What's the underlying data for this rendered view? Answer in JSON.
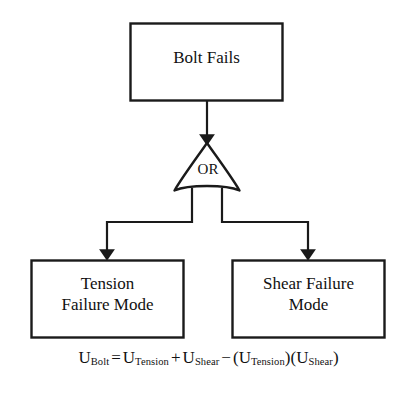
{
  "diagram": {
    "type": "fault-tree",
    "title_node": {
      "id": "top-event",
      "label": "Bolt Fails",
      "shape": "rectangle"
    },
    "gate": {
      "id": "or-gate",
      "label": "OR",
      "shape": "or-gate"
    },
    "children": [
      {
        "id": "tension-failure",
        "label": "Tension\nFailure Mode",
        "shape": "rectangle"
      },
      {
        "id": "shear-failure",
        "label": "Shear Failure\nMode",
        "shape": "rectangle"
      }
    ],
    "equation": {
      "lhs_symbol": "U",
      "lhs_sub": "Bolt",
      "eq": "=",
      "t1_symbol": "U",
      "t1_sub": "Tension",
      "plus": "+",
      "t2_symbol": "U",
      "t2_sub": "Shear",
      "minus": "−",
      "open1": "(",
      "t3_symbol": "U",
      "t3_sub": "Tension",
      "close1": ")",
      "open2": "(",
      "t4_symbol": "U",
      "t4_sub": "Shear",
      "close2": ")",
      "plain_text": "U_Bolt = U_Tension + U_Shear − (U_Tension)(U_Shear)"
    },
    "colors": {
      "stroke": "#1a1a1a",
      "fill": "#ffffff",
      "text": "#111111"
    }
  }
}
